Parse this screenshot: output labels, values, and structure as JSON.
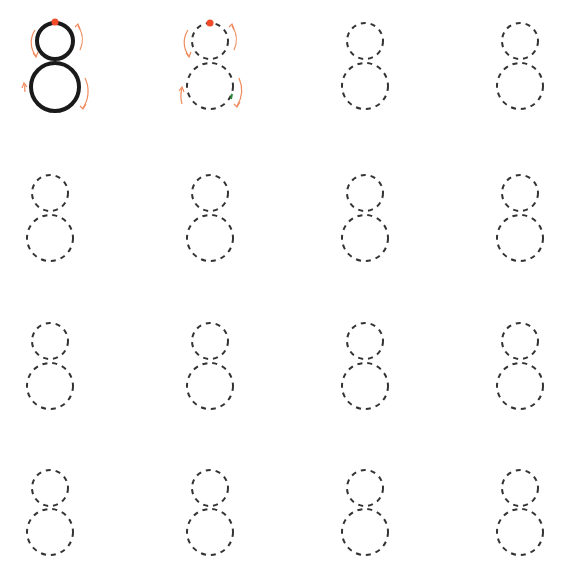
{
  "worksheet": {
    "subject": "Number 8 tracing practice",
    "digit": "8",
    "grid": {
      "rows": 4,
      "columns": 4
    },
    "colors": {
      "solid_stroke": "#1a1a1a",
      "dashed_stroke": "#333333",
      "guide_arrow": "#f08a5d",
      "start_dot": "#f24b2a",
      "end_mark": "#2e8b3a"
    },
    "cells": [
      {
        "row": 1,
        "col": 1,
        "type": "model-solid-with-arrows"
      },
      {
        "row": 1,
        "col": 2,
        "type": "trace-dashed-with-arrows"
      },
      {
        "row": 1,
        "col": 3,
        "type": "trace-dashed"
      },
      {
        "row": 1,
        "col": 4,
        "type": "trace-dashed"
      },
      {
        "row": 2,
        "col": 1,
        "type": "trace-dashed"
      },
      {
        "row": 2,
        "col": 2,
        "type": "trace-dashed"
      },
      {
        "row": 2,
        "col": 3,
        "type": "trace-dashed"
      },
      {
        "row": 2,
        "col": 4,
        "type": "trace-dashed"
      },
      {
        "row": 3,
        "col": 1,
        "type": "trace-dashed"
      },
      {
        "row": 3,
        "col": 2,
        "type": "trace-dashed"
      },
      {
        "row": 3,
        "col": 3,
        "type": "trace-dashed"
      },
      {
        "row": 3,
        "col": 4,
        "type": "trace-dashed"
      },
      {
        "row": 4,
        "col": 1,
        "type": "trace-dashed"
      },
      {
        "row": 4,
        "col": 2,
        "type": "trace-dashed"
      },
      {
        "row": 4,
        "col": 3,
        "type": "trace-dashed"
      },
      {
        "row": 4,
        "col": 4,
        "type": "trace-dashed"
      }
    ]
  }
}
